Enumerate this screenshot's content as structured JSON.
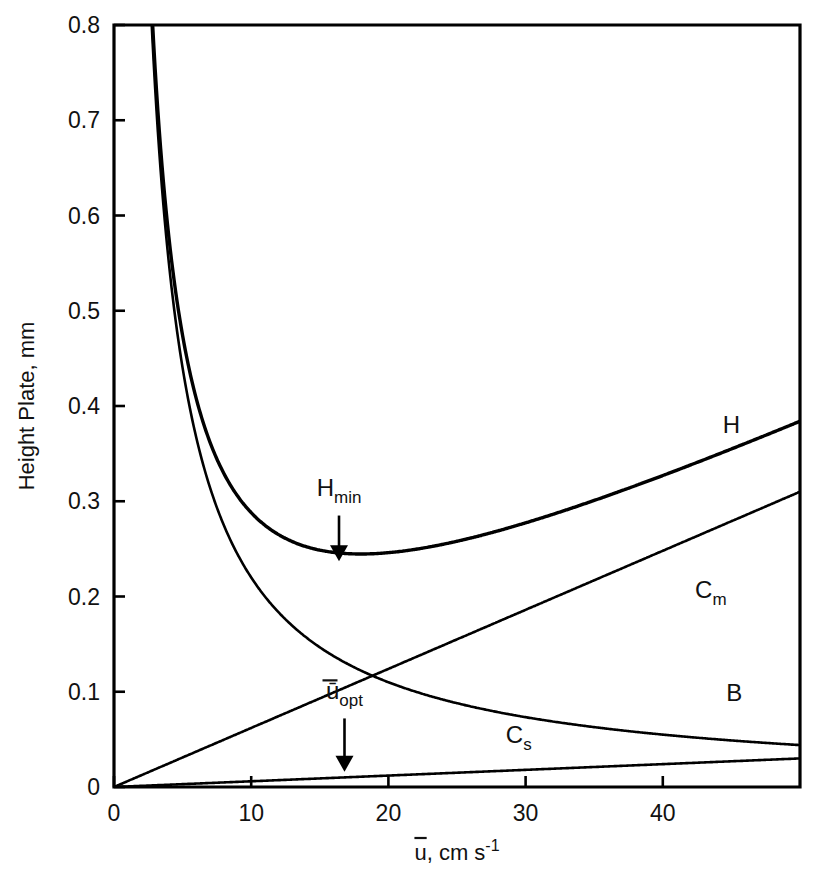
{
  "chart_data": {
    "type": "line",
    "title": "",
    "xlabel": "ū, cm s⁻¹",
    "ylabel": "Height Plate, mm",
    "xlim": [
      0,
      50
    ],
    "ylim": [
      0,
      0.8
    ],
    "grid": false,
    "legend_position": "inline-curve-labels",
    "xticks": [
      0,
      10,
      20,
      30,
      40
    ],
    "xtick_labels": [
      "0",
      "10",
      "20",
      "30",
      "40"
    ],
    "yticks": [
      0,
      0.1,
      0.2,
      0.3,
      0.4,
      0.5,
      0.6,
      0.7,
      0.8
    ],
    "ytick_labels": [
      "0",
      "0.1",
      "0.2",
      "0.3",
      "0.4",
      "0.5",
      "0.6",
      "0.7",
      "0.8"
    ],
    "x": [
      1.5,
      2,
      2.5,
      3,
      3.5,
      4,
      5,
      6,
      7,
      8,
      9,
      10,
      12,
      14,
      16,
      18,
      20,
      24,
      28,
      32,
      36,
      40,
      44,
      48,
      50
    ],
    "series": [
      {
        "name": "H",
        "label": "H",
        "equation": "H = B/u + (Cm + Cs)*u",
        "stroke_width": 3.4,
        "values": [
          1.477,
          1.114,
          0.897,
          0.753,
          0.652,
          0.577,
          0.474,
          0.41,
          0.368,
          0.339,
          0.32,
          0.306,
          0.292,
          0.29,
          0.296,
          0.306,
          0.32,
          0.355,
          0.395,
          0.437,
          0.48,
          0.525,
          0.57,
          0.616,
          0.639
        ]
      },
      {
        "name": "B",
        "label": "B",
        "equation": "B/u with B = 2.2",
        "stroke_width": 2.6,
        "values": [
          1.467,
          1.1,
          0.88,
          0.733,
          0.629,
          0.55,
          0.44,
          0.367,
          0.314,
          0.275,
          0.244,
          0.22,
          0.183,
          0.157,
          0.138,
          0.122,
          0.11,
          0.092,
          0.079,
          0.069,
          0.061,
          0.055,
          0.05,
          0.046,
          0.044
        ]
      },
      {
        "name": "Cm",
        "label": "Cₘ",
        "equation": "Cm*u with Cm = 0.0062",
        "stroke_width": 2.6,
        "values": [
          0.009,
          0.012,
          0.016,
          0.019,
          0.022,
          0.025,
          0.031,
          0.037,
          0.043,
          0.05,
          0.056,
          0.062,
          0.074,
          0.087,
          0.099,
          0.112,
          0.124,
          0.149,
          0.174,
          0.198,
          0.223,
          0.248,
          0.273,
          0.298,
          0.31
        ]
      },
      {
        "name": "Cs",
        "label": "Cₛ",
        "equation": "Cs*u with Cs = 0.0006",
        "stroke_width": 2.6,
        "values": [
          0.0009,
          0.0012,
          0.0015,
          0.0018,
          0.0021,
          0.0024,
          0.003,
          0.0036,
          0.0042,
          0.0048,
          0.0054,
          0.006,
          0.0072,
          0.0084,
          0.0096,
          0.0108,
          0.012,
          0.0144,
          0.0168,
          0.0192,
          0.0216,
          0.024,
          0.0264,
          0.0288,
          0.03
        ]
      }
    ],
    "annotations": [
      {
        "id": "h-min",
        "text": "H",
        "subscript": "min",
        "arrow_x": 16.4,
        "arrow_y_from": 0.285,
        "arrow_y_to": 0.237,
        "label_x": 16.4,
        "label_y": 0.305
      },
      {
        "id": "u-opt",
        "text": "ū",
        "subscript": "opt",
        "arrow_x": 16.8,
        "arrow_y_from": 0.072,
        "arrow_y_to": 0.016,
        "label_x": 16.8,
        "label_y": 0.092
      }
    ],
    "curve_labels": [
      {
        "name": "H",
        "text": "H",
        "subscript": "",
        "x": 45.0,
        "y": 0.372
      },
      {
        "name": "Cm",
        "text": "C",
        "subscript": "m",
        "x": 43.5,
        "y": 0.198
      },
      {
        "name": "B",
        "text": "B",
        "subscript": "",
        "x": 45.2,
        "y": 0.09
      },
      {
        "name": "Cs",
        "text": "C",
        "subscript": "s",
        "x": 29.5,
        "y": 0.046
      }
    ],
    "colors": {
      "curve": "#000000",
      "axis": "#000000",
      "text": "#111111",
      "background": "#ffffff"
    }
  },
  "axis": {
    "x_title_main": "u",
    "x_title_rest": ", cm s",
    "x_title_exponent": "-1",
    "y_title": "Height Plate, mm"
  }
}
